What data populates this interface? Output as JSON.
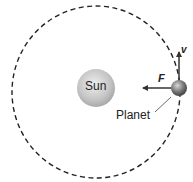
{
  "diagram": {
    "labels": {
      "sun": "Sun",
      "planet": "Planet",
      "force": "F",
      "velocity": "v"
    },
    "elements": {
      "orbit": {
        "style": "dashed",
        "shape": "ellipse"
      },
      "sun": {
        "color": "#c8c8c8"
      },
      "planet": {
        "color": "#7a7a7a"
      },
      "force_arrow": {
        "direction": "left (toward Sun)"
      },
      "velocity_arrow": {
        "direction": "up (tangent to orbit)"
      }
    },
    "colors": {
      "line": "#333333",
      "background": "#ffffff"
    }
  }
}
